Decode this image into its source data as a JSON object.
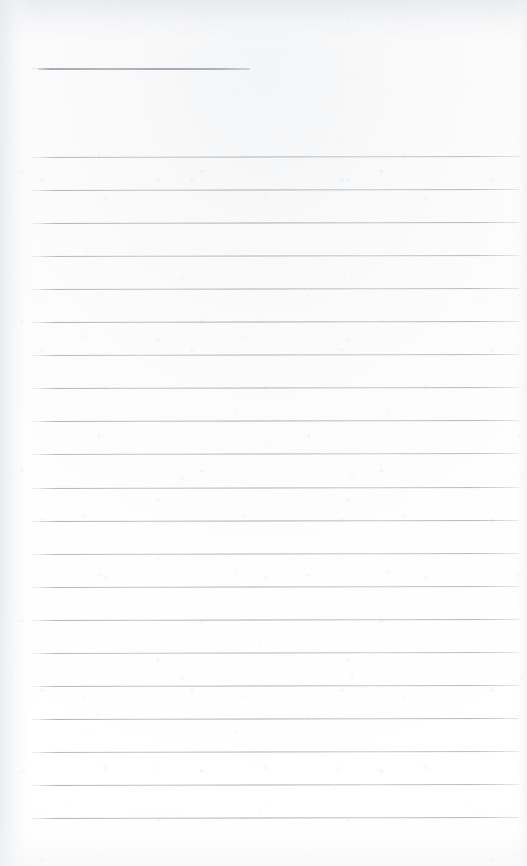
{
  "document": {
    "kind": "scanned-lined-notebook-page",
    "title": "",
    "visible_text": "",
    "page_width": 527,
    "page_height": 866,
    "background_color": "#fdfdfd",
    "rule_color": "#9aa2b0",
    "note": "Blank ruled page — no text, headings, numbers or labels are present in the image."
  },
  "header_rule": {
    "label": "",
    "x": 38,
    "y": 68,
    "width": 212,
    "thickness": 2
  },
  "ruled_lines": {
    "label": "",
    "count": 21,
    "x_start": 38,
    "x_end": 519,
    "first_y": 157,
    "spacing": 33.05,
    "skew_degrees": -0.12,
    "y_positions": [
      157,
      190.05,
      223.1,
      256.15,
      289.2,
      322.25,
      355.3,
      388.35,
      421.4,
      454.45,
      487.5,
      520.55,
      553.6,
      586.65,
      619.7,
      652.75,
      685.8,
      718.85,
      751.9,
      784.95,
      818
    ]
  },
  "margins": {
    "left_margin_label": "",
    "left": 38,
    "right": 8,
    "top_blank": 68,
    "bottom_blank": 48
  }
}
